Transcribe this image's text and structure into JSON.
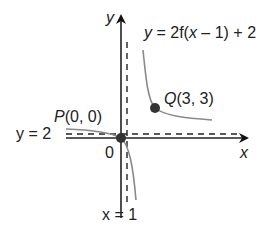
{
  "diagram": {
    "axes": {
      "x_label": "x",
      "y_label": "y",
      "origin_label": "0"
    },
    "asymptotes": {
      "vertical": "x = 1",
      "horizontal": "y = 2"
    },
    "curve_label": {
      "prefix": "y",
      "rest": " = 2f(",
      "var": "x",
      "tail": " – 1) + 2"
    },
    "points": [
      {
        "name": "P",
        "coords": "(0, 0)"
      },
      {
        "name": "Q",
        "coords": "(3, 3)"
      }
    ],
    "colors": {
      "axis": "#222222",
      "curve": "#8a8a8a",
      "point": "#333333",
      "asymptote": "#222222"
    }
  }
}
